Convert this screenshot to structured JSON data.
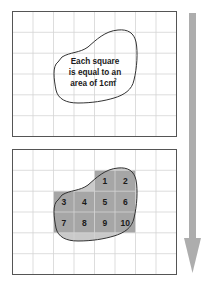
{
  "top_panel": {
    "caption_lines": [
      "Each square",
      "is equal to an",
      "area of 1cm"
    ],
    "caption_superscript": "2"
  },
  "bottom_panel": {
    "squares": [
      {
        "label": "1"
      },
      {
        "label": "2"
      },
      {
        "label": "3"
      },
      {
        "label": "4"
      },
      {
        "label": "5"
      },
      {
        "label": "6"
      },
      {
        "label": "7"
      },
      {
        "label": "8"
      },
      {
        "label": "9"
      },
      {
        "label": "10"
      }
    ]
  },
  "colors": {
    "grid_line": "#d4d4d4",
    "border": "#555555",
    "full_square_fill": "#a6a6a6",
    "partial_fill": "#c9c9c9",
    "outline": "#333333",
    "arrow": "#adadad"
  },
  "grid": {
    "columns": 8,
    "rows": 6,
    "unit": "1cm²"
  }
}
